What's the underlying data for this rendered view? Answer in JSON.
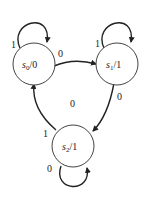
{
  "diagram": {
    "type": "state-machine (Moore)",
    "states": [
      {
        "id": "s0",
        "name": "s",
        "sub": "0",
        "output": "/0"
      },
      {
        "id": "s1",
        "name": "s",
        "sub": "1",
        "output": "/1"
      },
      {
        "id": "s2",
        "name": "s",
        "sub": "2",
        "output": "/1"
      }
    ],
    "transitions": [
      {
        "from": "s0",
        "to": "s0",
        "label": "1"
      },
      {
        "from": "s0",
        "to": "s1",
        "label": "0"
      },
      {
        "from": "s1",
        "to": "s1",
        "label": "1"
      },
      {
        "from": "s1",
        "to": "s2",
        "label": "0"
      },
      {
        "from": "s2",
        "to": "s0",
        "label": "1"
      },
      {
        "from": "s2",
        "to": "s2",
        "label": "0"
      }
    ],
    "center_label": "0"
  }
}
